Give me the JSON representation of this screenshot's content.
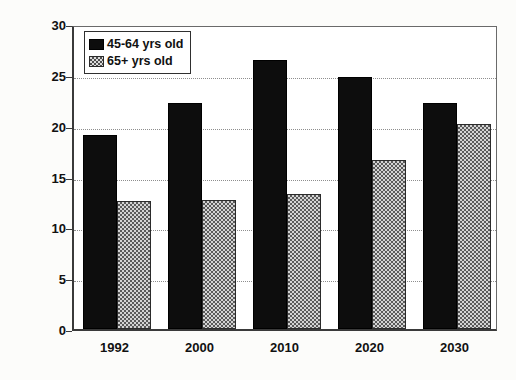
{
  "chart_data": {
    "type": "bar",
    "title": "",
    "xlabel": "",
    "ylabel": "Percent of Total Population",
    "categories": [
      "1992",
      "2000",
      "2010",
      "2020",
      "2030"
    ],
    "series": [
      {
        "name": "45-64 yrs old",
        "values": [
          19.1,
          22.2,
          26.5,
          24.8,
          22.2
        ],
        "color": "#0d0d0d",
        "fill": "solid-black"
      },
      {
        "name": "65+ yrs old",
        "values": [
          12.6,
          12.7,
          13.3,
          16.6,
          20.2
        ],
        "color": "#d3d3d3",
        "fill": "checkerboard"
      }
    ],
    "ylim": [
      0,
      30
    ],
    "ytick_values": [
      0,
      5,
      10,
      15,
      20,
      25,
      30
    ],
    "ytick_labels": [
      "0",
      "5",
      "10",
      "15",
      "20",
      "25",
      "30"
    ],
    "grid": "horizontal-dotted",
    "legend_position": "top-left-inside"
  },
  "legend": {
    "entries": [
      {
        "label": "45-64 yrs old"
      },
      {
        "label": "65+ yrs old"
      }
    ]
  }
}
